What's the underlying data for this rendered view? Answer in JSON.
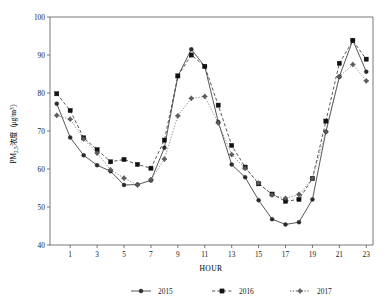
{
  "chart_data": {
    "type": "line",
    "title": "",
    "xlabel": "HOUR",
    "ylabel": "PM2.5浓度 ( μg/m3 )",
    "ylabel_parts": {
      "prefix": "PM",
      "subscript": "2.5",
      "middle": "浓度（",
      "unit_prefix": "μg/m",
      "unit_superscript": "3",
      "suffix": "）"
    },
    "x": [
      0,
      1,
      2,
      3,
      4,
      5,
      6,
      7,
      8,
      9,
      10,
      11,
      12,
      13,
      14,
      15,
      16,
      17,
      18,
      19,
      20,
      21,
      22,
      23
    ],
    "xlim": [
      -0.5,
      23.5
    ],
    "ylim": [
      40,
      100
    ],
    "xticks": [
      1,
      3,
      5,
      7,
      9,
      11,
      13,
      15,
      17,
      19,
      21,
      23
    ],
    "yticks": [
      40,
      50,
      60,
      70,
      80,
      90,
      100
    ],
    "grid": false,
    "legend_position": "bottom",
    "series": [
      {
        "name": "2015",
        "marker": "circle",
        "linestyle": "solid",
        "color": "#2b2b2b",
        "values": [
          77.2,
          68.3,
          63.6,
          61.0,
          59.4,
          55.8,
          55.9,
          57.0,
          65.6,
          84.4,
          91.5,
          87.0,
          72.4,
          61.2,
          57.8,
          51.8,
          46.8,
          45.4,
          46.0,
          52.0,
          69.8,
          84.3,
          93.9,
          85.6
        ]
      },
      {
        "name": "2016",
        "marker": "square",
        "linestyle": "dashed",
        "color": "#111111",
        "values": [
          79.8,
          75.4,
          68.2,
          65.1,
          61.9,
          62.5,
          61.2,
          60.2,
          67.6,
          84.5,
          90.0,
          87.0,
          76.8,
          66.2,
          60.5,
          56.1,
          53.4,
          51.5,
          52.0,
          57.5,
          72.6,
          87.8,
          93.8,
          88.9
        ]
      },
      {
        "name": "2017",
        "marker": "diamond",
        "linestyle": "dotted",
        "color": "#5c5c5c",
        "values": [
          74.1,
          73.1,
          67.9,
          64.2,
          59.8,
          57.6,
          55.8,
          57.2,
          62.6,
          74.0,
          78.6,
          79.1,
          72.1,
          63.8,
          60.2,
          56.3,
          53.2,
          52.3,
          53.3,
          57.5,
          69.8,
          84.3,
          87.5,
          83.2
        ]
      }
    ]
  },
  "legend": {
    "items": [
      {
        "label": "2015",
        "marker": "circle",
        "linestyle": "solid"
      },
      {
        "label": "2016",
        "marker": "square",
        "linestyle": "dashed"
      },
      {
        "label": "2017",
        "marker": "diamond",
        "linestyle": "dotted"
      }
    ]
  },
  "axes": {
    "x_title": "HOUR",
    "y_tick_labels": [
      "40",
      "50",
      "60",
      "70",
      "80",
      "90",
      "100"
    ],
    "x_tick_labels": [
      "1",
      "3",
      "5",
      "7",
      "9",
      "11",
      "13",
      "15",
      "17",
      "19",
      "21",
      "23"
    ]
  },
  "colors": {
    "background": "#ffffff",
    "axis": "#555555",
    "ink": "#1a1a1a"
  }
}
